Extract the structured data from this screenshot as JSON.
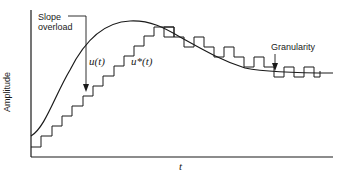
{
  "figure": {
    "labels": {
      "slope_overload_line1": "Slope",
      "slope_overload_line2": "overload",
      "u_t": "u(t)",
      "u_star_t": "u*(t)",
      "granularity": "Granularity",
      "x_axis": "t",
      "y_axis": "Amplitude"
    },
    "colors": {
      "stroke": "#1a1a1a",
      "background": "#ffffff"
    }
  }
}
